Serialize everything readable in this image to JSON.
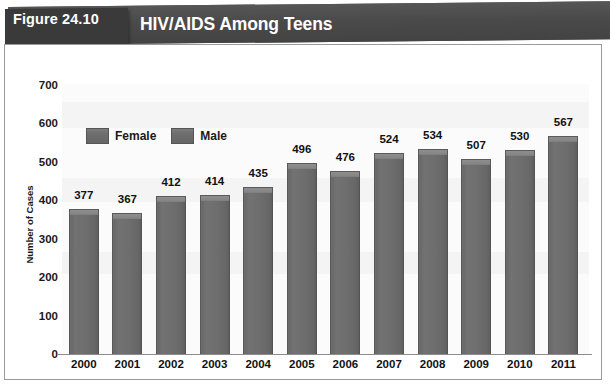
{
  "figure": {
    "tag_label": "Figure 24.10",
    "title": "HIV/AIDS Among Teens"
  },
  "chart_data": {
    "type": "bar",
    "title": "HIV/AIDS Among Teens",
    "xlabel": "",
    "ylabel": "Number of Cases",
    "categories": [
      "2000",
      "2001",
      "2002",
      "2003",
      "2004",
      "2005",
      "2006",
      "2007",
      "2008",
      "2009",
      "2010",
      "2011"
    ],
    "values": [
      377,
      367,
      412,
      414,
      435,
      496,
      476,
      524,
      534,
      507,
      530,
      567
    ],
    "series": [
      {
        "name": "Female",
        "values": [
          377,
          367,
          412,
          414,
          435,
          496,
          476,
          524,
          534,
          507,
          530,
          567
        ]
      }
    ],
    "legend": [
      "Female",
      "Male"
    ],
    "legend_position": "inside-top-left",
    "ylim": [
      0,
      700
    ],
    "yticks": [
      0,
      100,
      200,
      300,
      400,
      500,
      600,
      700
    ],
    "ytick_labels": [
      "0",
      "100",
      "200",
      "300",
      "400",
      "500",
      "600",
      "700"
    ],
    "grid": false,
    "data_labels": true,
    "bar_color": "#6e6e6e",
    "bar_top_color": "#868686"
  },
  "colors": {
    "banner": "#4b4b4b",
    "figure_tag": "#3a3a3a",
    "banner_text": "#ffffff",
    "axis_text": "#111111",
    "frame_border": "#9a9a9a",
    "plot_background": "#fbfbfb"
  }
}
